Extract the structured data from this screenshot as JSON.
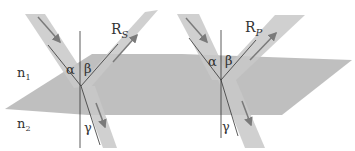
{
  "diagram": {
    "colors": {
      "plane": "#b4b4b4",
      "beam": "#c6c6c6",
      "arrow": "#7a7a7a",
      "line": "#333333",
      "text": "#333333"
    },
    "media": {
      "upper": "n",
      "upper_sub": "1",
      "lower": "n",
      "lower_sub": "2"
    },
    "left": {
      "reflected_label": "R",
      "reflected_sub": "S",
      "angle_incidence": "α",
      "angle_reflection": "β",
      "angle_refraction": "γ"
    },
    "right": {
      "reflected_label": "R",
      "reflected_sub": "P",
      "angle_incidence": "α",
      "angle_reflection": "β",
      "angle_refraction": "γ"
    }
  }
}
